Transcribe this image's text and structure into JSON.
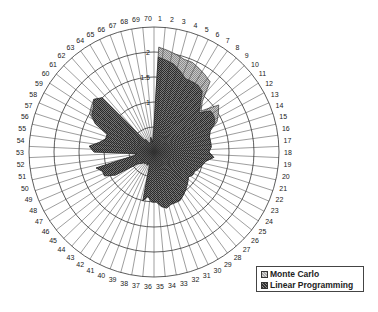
{
  "chart_data": {
    "type": "radar",
    "title": "",
    "categories": [
      "1",
      "2",
      "3",
      "4",
      "5",
      "6",
      "7",
      "8",
      "9",
      "10",
      "11",
      "12",
      "13",
      "14",
      "15",
      "16",
      "17",
      "18",
      "19",
      "20",
      "21",
      "22",
      "23",
      "24",
      "25",
      "26",
      "27",
      "28",
      "29",
      "30",
      "31",
      "32",
      "33",
      "34",
      "35",
      "36",
      "37",
      "38",
      "39",
      "40",
      "41",
      "42",
      "43",
      "44",
      "45",
      "46",
      "47",
      "48",
      "49",
      "50",
      "51",
      "52",
      "53",
      "54",
      "55",
      "56",
      "57",
      "58",
      "59",
      "60",
      "61",
      "62",
      "63",
      "64",
      "65",
      "66",
      "67",
      "68",
      "69",
      "70"
    ],
    "radial_ticks": [
      "1",
      "1.5",
      "2"
    ],
    "rlim": [
      0,
      2.5
    ],
    "rings": [
      0.5,
      1,
      1.5,
      2,
      2.5
    ],
    "series": [
      {
        "name": "Monte Carlo",
        "values": [
          2.1,
          2.05,
          2.0,
          1.95,
          1.95,
          1.9,
          1.85,
          1.8,
          1.4,
          1.25,
          1.6,
          1.5,
          1.4,
          1.2,
          1.15,
          1.15,
          1.15,
          1.1,
          1.2,
          1.05,
          1.0,
          0.95,
          0.9,
          0.9,
          0.85,
          0.9,
          0.95,
          1.0,
          1.05,
          1.1,
          1.1,
          1.1,
          1.15,
          1.1,
          1.0,
          1.0,
          0.9,
          1.0,
          0.3,
          0.25,
          0.3,
          0.25,
          0.3,
          0.3,
          0.35,
          0.4,
          0.9,
          1.1,
          1.1,
          1.2,
          0.4,
          0.35,
          1.2,
          1.3,
          1.1,
          1.0,
          1.0,
          1.3,
          1.5,
          1.55,
          1.6,
          1.5,
          0.3,
          0.3,
          0.2,
          0.2,
          0.2,
          0.3,
          0.2,
          0.3
        ]
      },
      {
        "name": "Linear Programming",
        "values": [
          1.9,
          1.85,
          1.8,
          1.7,
          1.6,
          1.6,
          1.6,
          1.55,
          1.35,
          1.2,
          1.4,
          1.4,
          1.35,
          1.2,
          1.15,
          1.15,
          1.15,
          1.1,
          1.2,
          1.05,
          1.0,
          0.95,
          0.9,
          0.9,
          0.85,
          0.9,
          0.95,
          1.0,
          1.05,
          1.1,
          1.1,
          1.1,
          1.15,
          1.1,
          1.0,
          1.0,
          0.9,
          1.0,
          0.3,
          0.25,
          0.3,
          0.25,
          0.3,
          0.3,
          0.35,
          0.4,
          0.9,
          1.1,
          1.1,
          1.2,
          0.4,
          0.35,
          1.2,
          1.3,
          1.1,
          1.0,
          1.0,
          1.3,
          1.45,
          1.5,
          1.6,
          1.5,
          0.3,
          0.3,
          0.2,
          0.2,
          0.2,
          0.3,
          0.2,
          0.3
        ]
      }
    ],
    "legend_position": "bottom-right",
    "grid": true
  },
  "legend": {
    "items": [
      {
        "label": "Monte Carlo"
      },
      {
        "label": "Linear Programming"
      }
    ]
  }
}
